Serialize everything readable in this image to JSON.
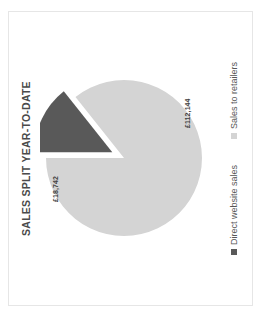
{
  "chart_data": {
    "type": "pie",
    "title": "SALES SPLIT YEAR-TO-DATE",
    "xlabel": "",
    "ylabel": "",
    "grid": false,
    "legend_position": "bottom",
    "rotation_note": "figure rendered rotated 90 degrees counter-clockwise",
    "currency_symbol": "£",
    "total": 130886,
    "categories": [
      "Direct website sales",
      "Sales to retailers"
    ],
    "values": [
      18742,
      112144
    ],
    "data_labels": [
      "£18,742",
      "£112,144"
    ],
    "percentages": [
      14.3,
      85.7
    ],
    "exploded": [
      true,
      false
    ],
    "colors": [
      "#595959",
      "#d4d4d4"
    ],
    "slices": [
      {
        "name": "Direct website sales",
        "value": 18742,
        "label": "£18,742",
        "percent": 14.3,
        "color": "#595959",
        "exploded": true
      },
      {
        "name": "Sales to retailers",
        "value": 112144,
        "label": "£112,144",
        "percent": 85.7,
        "color": "#d4d4d4",
        "exploded": false
      }
    ]
  },
  "legend": {
    "items": [
      {
        "label": "Direct website sales",
        "color": "#595959"
      },
      {
        "label": "Sales to retailers",
        "color": "#d4d4d4"
      }
    ]
  }
}
